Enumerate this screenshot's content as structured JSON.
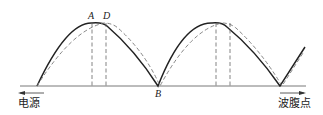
{
  "diagram": {
    "type": "standing-wave-distribution",
    "labels": {
      "left": "电源",
      "right": "波腹点",
      "point_a": "A",
      "point_d": "D",
      "point_b": "B"
    },
    "curves": [
      {
        "name": "solid-wave",
        "style": "solid",
        "color": "#222222"
      },
      {
        "name": "dashed-wave",
        "style": "dashed",
        "color": "#777777"
      }
    ],
    "markers": {
      "vertical_dashed_lines": 4
    }
  }
}
